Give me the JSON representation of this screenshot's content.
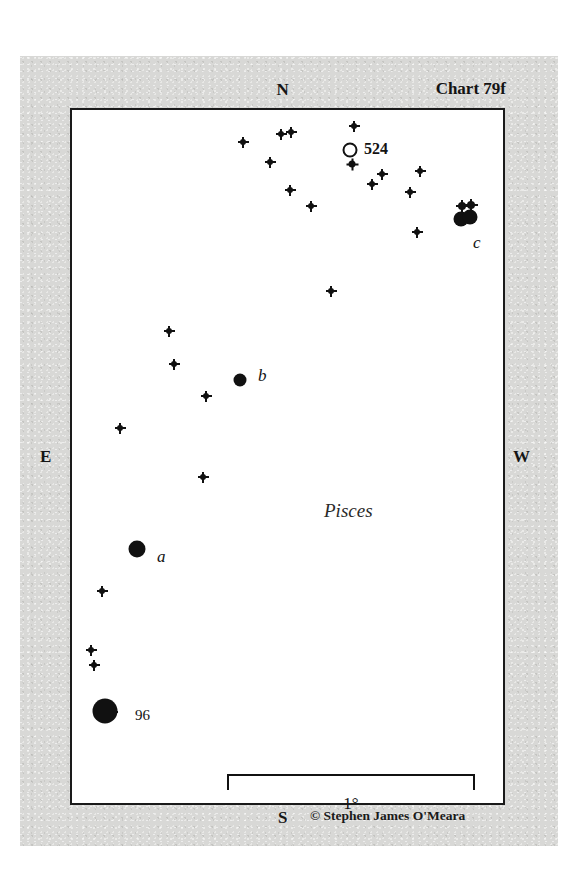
{
  "chart": {
    "title": "Chart 79f",
    "credit": "© Stephen James O'Meara",
    "constellation": "Pisces",
    "cardinals": {
      "north": "N",
      "south": "S",
      "east": "E",
      "west": "W"
    },
    "scale": {
      "label": "1°",
      "degrees": 1
    },
    "frame": {
      "left": 70,
      "top": 108,
      "width": 435,
      "height": 697,
      "border_color": "#1a1a1a",
      "sky_color": "#ffffff"
    },
    "paper_color": "#d8d8d6",
    "ink_color": "#111111"
  },
  "chart_data": {
    "type": "scatter",
    "title": "Chart 79f",
    "subtitle": "Pisces",
    "xlabel": "",
    "ylabel": "",
    "grid": false,
    "legend": "none",
    "xlim": [
      0,
      435
    ],
    "ylim": [
      0,
      697
    ],
    "orientation": {
      "top": "N",
      "bottom": "S",
      "left": "E",
      "right": "W"
    },
    "scale_bar": {
      "label": "1°",
      "x_start": 155,
      "x_end": 403,
      "y": 664
    },
    "series": [
      {
        "name": "stars",
        "marker": "filled-circle",
        "points": [
          {
            "x": 171,
            "y": 32,
            "size": 6,
            "label": ""
          },
          {
            "x": 209,
            "y": 24,
            "size": 6,
            "label": ""
          },
          {
            "x": 219,
            "y": 22,
            "size": 6,
            "label": ""
          },
          {
            "x": 282,
            "y": 16,
            "size": 6,
            "label": ""
          },
          {
            "x": 280,
            "y": 54,
            "size": 7,
            "label": ""
          },
          {
            "x": 198,
            "y": 52,
            "size": 6,
            "label": ""
          },
          {
            "x": 310,
            "y": 64,
            "size": 6,
            "label": ""
          },
          {
            "x": 218,
            "y": 80,
            "size": 6,
            "label": ""
          },
          {
            "x": 239,
            "y": 96,
            "size": 6,
            "label": ""
          },
          {
            "x": 338,
            "y": 82,
            "size": 6,
            "label": ""
          },
          {
            "x": 348,
            "y": 61,
            "size": 6,
            "label": ""
          },
          {
            "x": 300,
            "y": 74,
            "size": 6,
            "label": ""
          },
          {
            "x": 345,
            "y": 122,
            "size": 6,
            "label": ""
          },
          {
            "x": 390,
            "y": 96,
            "size": 8,
            "label": ""
          },
          {
            "x": 399,
            "y": 95,
            "size": 8,
            "label": ""
          },
          {
            "x": 259,
            "y": 181,
            "size": 6,
            "label": ""
          },
          {
            "x": 97,
            "y": 221,
            "size": 6,
            "label": ""
          },
          {
            "x": 102,
            "y": 254,
            "size": 6,
            "label": ""
          },
          {
            "x": 134,
            "y": 286,
            "size": 6,
            "label": ""
          },
          {
            "x": 48,
            "y": 318,
            "size": 6,
            "label": ""
          },
          {
            "x": 131,
            "y": 367,
            "size": 6,
            "label": ""
          },
          {
            "x": 30,
            "y": 481,
            "size": 6,
            "label": ""
          },
          {
            "x": 19,
            "y": 540,
            "size": 6,
            "label": ""
          },
          {
            "x": 22,
            "y": 555,
            "size": 6,
            "label": ""
          },
          {
            "x": 26,
            "y": 600,
            "size": 6,
            "label": ""
          },
          {
            "x": 40,
            "y": 602,
            "size": 6,
            "label": ""
          }
        ]
      },
      {
        "name": "labeled-stars",
        "marker": "filled-circle",
        "points": [
          {
            "x": 168,
            "y": 270,
            "size": 13,
            "label": "b",
            "label_style": "italic",
            "label_dx": 18,
            "label_dy": -4
          },
          {
            "x": 389,
            "y": 109,
            "size": 15,
            "label": "c",
            "label_style": "italic",
            "label_dx": 12,
            "label_dy": 24
          },
          {
            "x": 398,
            "y": 107,
            "size": 15,
            "label": "",
            "label_style": "italic",
            "label_dx": 0,
            "label_dy": 0
          },
          {
            "x": 65,
            "y": 439,
            "size": 17,
            "label": "a",
            "label_style": "italic",
            "label_dx": 20,
            "label_dy": 8
          },
          {
            "x": 33,
            "y": 601,
            "size": 25,
            "label": "96",
            "label_style": "plain",
            "label_dx": 30,
            "label_dy": 6
          }
        ]
      },
      {
        "name": "deep-sky-objects",
        "marker": "open-circle",
        "points": [
          {
            "x": 278,
            "y": 40,
            "size": 15,
            "label": "524",
            "label_style": "bold",
            "label_dx": 14,
            "label_dy": 0
          }
        ]
      }
    ]
  },
  "objects": {
    "ngc524_label": "524",
    "star96_label": "96",
    "star_a_label": "a",
    "star_b_label": "b",
    "star_c_label": "c"
  }
}
